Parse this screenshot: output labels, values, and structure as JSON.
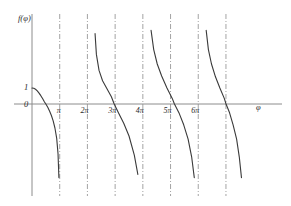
{
  "chart_data": {
    "type": "line",
    "title": "",
    "xlabel": "φ",
    "ylabel": "f(φ)",
    "grid": false,
    "legend": null,
    "xtick_labels": [
      "π",
      "2π",
      "3π",
      "4π",
      "5π",
      "6π"
    ],
    "xtick_values": [
      3.1416,
      6.2832,
      9.4248,
      12.5664,
      15.708,
      18.8496
    ],
    "ytick_labels": [
      "1",
      "0"
    ],
    "ytick_values": [
      1,
      0
    ],
    "xlim": [
      -0.6,
      23.0
    ],
    "ylim": [
      -6.2,
      6.2
    ],
    "asymptotes": {
      "style": "dash-dot",
      "label": "vertical asymptotes",
      "values": [
        3.1416,
        6.2832,
        9.4248,
        12.5664,
        15.708,
        18.8496,
        21.9911
      ]
    },
    "series": [
      {
        "name": "branch-0",
        "comment": "descends from (0,1) through zero crossing, diverges to -inf at pi",
        "points": [
          [
            0.0,
            1.0
          ],
          [
            0.2,
            0.98
          ],
          [
            0.4,
            0.92
          ],
          [
            0.6,
            0.82
          ],
          [
            0.8,
            0.68
          ],
          [
            1.0,
            0.52
          ],
          [
            1.2,
            0.34
          ],
          [
            1.4,
            0.14
          ],
          [
            1.5708,
            0.0
          ],
          [
            1.8,
            -0.22
          ],
          [
            2.0,
            -0.45
          ],
          [
            2.2,
            -0.72
          ],
          [
            2.4,
            -1.05
          ],
          [
            2.6,
            -1.5
          ],
          [
            2.8,
            -2.15
          ],
          [
            2.95,
            -3.1
          ],
          [
            3.05,
            -4.6
          ],
          [
            3.1,
            -6.2
          ]
        ]
      },
      {
        "name": "branch-1",
        "comment": "rises from -inf at 2pi+, crosses zero just before 3pi, falls to -inf at 3pi+",
        "points": [
          [
            7.05,
            6.2
          ],
          [
            7.15,
            4.4
          ],
          [
            7.3,
            3.1
          ],
          [
            7.6,
            2.1
          ],
          [
            8.0,
            1.45
          ],
          [
            8.5,
            0.95
          ],
          [
            9.0,
            0.45
          ],
          [
            9.32,
            0.0
          ],
          [
            9.8,
            -0.55
          ],
          [
            10.4,
            -1.2
          ],
          [
            11.0,
            -2.0
          ],
          [
            11.6,
            -3.2
          ],
          [
            12.0,
            -4.4
          ],
          [
            12.3,
            -6.2
          ]
        ]
      },
      {
        "name": "branch-2",
        "comment": "from +inf near 4pi, crosses zero just after 5pi, to -inf before 6pi",
        "points": [
          [
            13.3,
            6.2
          ],
          [
            13.5,
            4.6
          ],
          [
            13.8,
            3.4
          ],
          [
            14.2,
            2.5
          ],
          [
            14.7,
            1.75
          ],
          [
            15.3,
            1.0
          ],
          [
            15.9,
            0.35
          ],
          [
            16.15,
            0.0
          ],
          [
            16.7,
            -0.6
          ],
          [
            17.2,
            -1.3
          ],
          [
            17.7,
            -2.2
          ],
          [
            18.1,
            -3.3
          ],
          [
            18.4,
            -4.6
          ],
          [
            18.6,
            -6.2
          ]
        ]
      },
      {
        "name": "branch-3",
        "comment": "from +inf near 6pi, crosses zero after 6pi, to -inf before 7pi",
        "points": [
          [
            19.55,
            6.2
          ],
          [
            19.75,
            4.6
          ],
          [
            20.0,
            3.4
          ],
          [
            20.35,
            2.5
          ],
          [
            20.8,
            1.7
          ],
          [
            21.3,
            1.0
          ],
          [
            21.8,
            0.35
          ],
          [
            22.0,
            0.0
          ],
          [
            22.4,
            -0.55
          ],
          [
            22.8,
            -1.3
          ],
          [
            23.2,
            -2.2
          ],
          [
            23.5,
            -3.3
          ],
          [
            23.75,
            -4.6
          ],
          [
            23.95,
            -6.2
          ]
        ]
      }
    ]
  },
  "figure": {
    "axes": {
      "x_axis_name": "horizontal-axis",
      "y_axis_name": "vertical-axis"
    },
    "colors": {
      "curve": "#3a3a3a",
      "axis": "#8c8c8c",
      "asymptote": "#9a9a9a",
      "text": "#2b2b2b",
      "background": "#ffffff"
    }
  }
}
